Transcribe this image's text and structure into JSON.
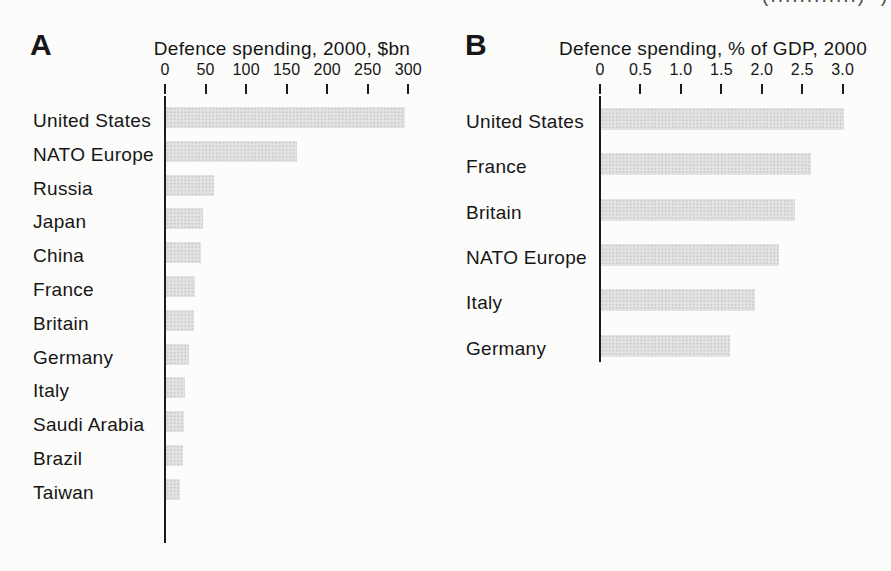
{
  "page_artifact": {
    "text": "(............)  )"
  },
  "chart_data": [
    {
      "type": "bar",
      "orientation": "horizontal",
      "panel_label": "A",
      "title": "Defence spending, 2000, $bn",
      "categories": [
        "United States",
        "NATO Europe",
        "Russia",
        "Japan",
        "China",
        "France",
        "Britain",
        "Germany",
        "Italy",
        "Saudi Arabia",
        "Brazil",
        "Taiwan"
      ],
      "values": [
        295,
        162,
        59,
        46,
        43,
        36,
        35,
        28,
        24,
        22,
        21,
        17
      ],
      "xlabel": "",
      "ylabel": "",
      "xlim": [
        0,
        300
      ],
      "xticks": [
        0,
        50,
        100,
        150,
        200,
        250,
        300
      ],
      "xtick_labels": [
        "0",
        "50",
        "100",
        "150",
        "200",
        "250",
        "300"
      ],
      "grid": false,
      "legend": "none",
      "bar_color": "#e3e3e3",
      "axis_color": "#1c1c1c"
    },
    {
      "type": "bar",
      "orientation": "horizontal",
      "panel_label": "B",
      "title": "Defence spending, % of GDP, 2000",
      "categories": [
        "United States",
        "France",
        "Britain",
        "NATO Europe",
        "Italy",
        "Germany"
      ],
      "values": [
        3.0,
        2.6,
        2.4,
        2.2,
        1.9,
        1.6
      ],
      "xlabel": "",
      "ylabel": "",
      "xlim": [
        0,
        3.0
      ],
      "xticks": [
        0,
        0.5,
        1.0,
        1.5,
        2.0,
        2.5,
        3.0
      ],
      "xtick_labels": [
        "0",
        "0.5",
        "1.0",
        "1.5",
        "2.0",
        "2.5",
        "3.0"
      ],
      "grid": false,
      "legend": "none",
      "bar_color": "#e3e3e3",
      "axis_color": "#1c1c1c"
    }
  ]
}
